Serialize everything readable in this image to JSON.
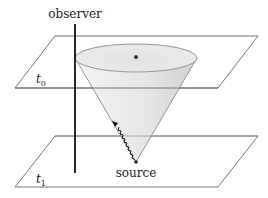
{
  "diagram": {
    "labels": {
      "observer": "observer",
      "source": "source",
      "t0": "t",
      "t0_sub": "0",
      "t1": "t",
      "t1_sub": "1"
    },
    "elements": {
      "top_plane": "time slice t0",
      "bottom_plane": "time slice t1",
      "observer_worldline": "observer worldline",
      "light_cone": "future light cone from source",
      "signal": "wavy light signal"
    },
    "colors": {
      "plane_stroke": "#555555",
      "cone_stroke": "#8a8a8a",
      "cone_fill": "#e8e8e8",
      "worldline": "#111111",
      "dot": "#333333"
    }
  }
}
